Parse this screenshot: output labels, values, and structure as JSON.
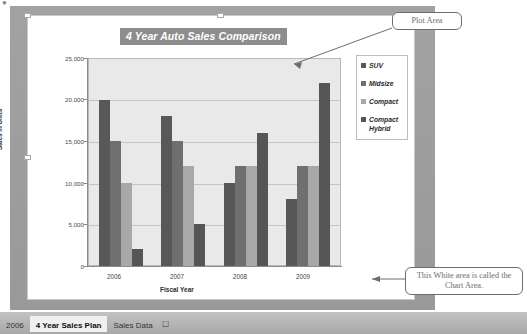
{
  "chart_data": {
    "type": "bar",
    "title": "4 Year Auto Sales Comparison",
    "xlabel": "Fiscal Year",
    "ylabel": "Sales in Units",
    "categories": [
      "2006",
      "2007",
      "2008",
      "2009"
    ],
    "series": [
      {
        "name": "SUV",
        "color": "#585858",
        "values": [
          20000,
          18000,
          10000,
          8000
        ]
      },
      {
        "name": "Midsize",
        "color": "#6f6f6f",
        "values": [
          15000,
          15000,
          12000,
          12000
        ]
      },
      {
        "name": "Compact",
        "color": "#a8a8a8",
        "values": [
          10000,
          12000,
          12000,
          12000
        ]
      },
      {
        "name": "Compact Hybrid",
        "color": "#555555",
        "values": [
          2000,
          5000,
          16000,
          22000
        ]
      }
    ],
    "ylim": [
      0,
      25000
    ],
    "ytick_labels": [
      "25,000",
      "20,000",
      "15,000",
      "10,000",
      "5,000",
      "0"
    ],
    "ytick_values": [
      25000,
      20000,
      15000,
      10000,
      5000,
      0
    ],
    "grid": true,
    "legend_position": "right",
    "plot_background": "#e9e9e9",
    "chart_background": "#ffffff",
    "title_background": "#8d8d8d",
    "title_color": "#ffffff"
  },
  "legend": {
    "items": [
      {
        "label": "SUV",
        "color": "#585858"
      },
      {
        "label": "Midsize",
        "color": "#6f6f6f"
      },
      {
        "label": "Compact",
        "color": "#a8a8a8"
      },
      {
        "label": "Compact Hybrid",
        "color": "#555555"
      }
    ]
  },
  "callouts": [
    {
      "id": "plot-area",
      "text": "Plot Area"
    },
    {
      "id": "chart-area",
      "text": "This White area is called the Chart Area."
    }
  ],
  "sheet_tabs": {
    "items": [
      {
        "label": "2006",
        "active": false
      },
      {
        "label": "4 Year Sales Plan",
        "active": true
      },
      {
        "label": "Sales Data",
        "active": false
      }
    ],
    "insert_sheet_icon": "insert-worksheet-icon",
    "scroll_left_icon": "scroll-left-arrow-icon"
  }
}
